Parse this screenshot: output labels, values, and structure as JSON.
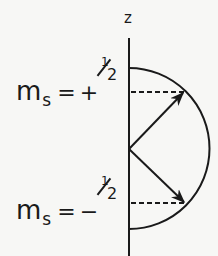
{
  "figure": {
    "axis_label": "z",
    "states": [
      {
        "symbol": "m",
        "subscript": "s",
        "equals": "=",
        "sign": "+",
        "numerator": "1",
        "denominator": "2",
        "value": "+1/2",
        "projection_y": 92
      },
      {
        "symbol": "m",
        "subscript": "s",
        "equals": "=",
        "sign": "−",
        "numerator": "1",
        "denominator": "2",
        "value": "-1/2",
        "projection_y": 203
      }
    ],
    "geometry": {
      "axis": {
        "x": 129,
        "y1": 38,
        "y2": 256
      },
      "semicircle": {
        "cx": 129,
        "cy": 148.5,
        "r": 80.5
      },
      "origin": {
        "x": 129,
        "y": 149
      },
      "vector_up_tip": {
        "x": 184,
        "y": 92
      },
      "vector_down_tip": {
        "x": 185,
        "y": 203
      }
    },
    "colors": {
      "ink": "#1a1a1a",
      "paper": "#f7f7f5"
    }
  }
}
